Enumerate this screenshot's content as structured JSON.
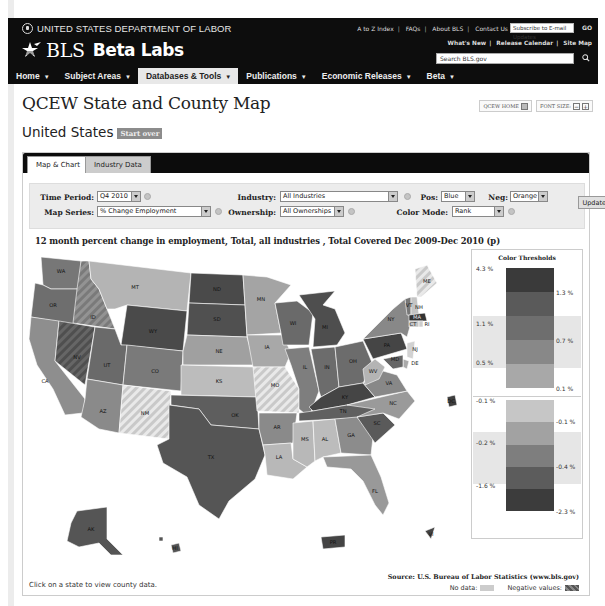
{
  "header": {
    "agency": "UNITED STATES DEPARTMENT OF LABOR",
    "brand_bls": "BLS",
    "brand_beta": "Beta Labs",
    "top_links": [
      "A to Z Index",
      "FAQs",
      "About BLS",
      "Contact Us"
    ],
    "subscribe_placeholder": "Subscribe to E-mail Updates",
    "go_label": "GO",
    "release_links": [
      "What's New",
      "Release Calendar",
      "Site Map"
    ],
    "search_placeholder": "Search BLS.gov",
    "nav": [
      {
        "label": "Home"
      },
      {
        "label": "Subject Areas"
      },
      {
        "label": "Databases & Tools",
        "active": true
      },
      {
        "label": "Publications"
      },
      {
        "label": "Economic Releases"
      },
      {
        "label": "Beta"
      }
    ]
  },
  "page": {
    "title": "QCEW State and County Map",
    "qcew_home": "QCEW HOME",
    "font_size": "FONT SIZE:",
    "font_minus": "−",
    "font_plus": "+",
    "region": "United States",
    "start_over": "Start over"
  },
  "tabs": [
    {
      "label": "Map & Chart",
      "active": true
    },
    {
      "label": "Industry Data"
    }
  ],
  "controls": {
    "time_period_label": "Time Period:",
    "time_period_value": "Q4 2010",
    "map_series_label": "Map Series:",
    "map_series_value": "% Change Employment",
    "industry_label": "Industry:",
    "industry_value": "All Industries",
    "ownership_label": "Ownership:",
    "ownership_value": "All Ownerships",
    "pos_label": "Pos:",
    "pos_value": "Blue",
    "neg_label": "Neg:",
    "neg_value": "Orange",
    "color_mode_label": "Color Mode:",
    "color_mode_value": "Rank",
    "update_label": "Update"
  },
  "chart_title": "12 month percent change in employment, Total, all industries , Total Covered Dec 2009-Dec 2010 (p)",
  "legend": {
    "title": "Color Thresholds",
    "positive": {
      "left_labels": [
        "4.3 %",
        "1.1 %",
        "0.5 %"
      ],
      "right_labels": [
        "1.3 %",
        "0.7 %",
        "0.1 %"
      ],
      "colors": [
        "#3a3a3a",
        "#5a5a5a",
        "#6e6e6e",
        "#888888",
        "#a8a8a8"
      ]
    },
    "negative": {
      "left_labels": [
        "-0.1 %",
        "-0.2 %",
        "-1.6 %"
      ],
      "right_labels": [
        "-0.1 %",
        "-0.4 %",
        "-2.3 %"
      ],
      "colors": [
        "#c6c6c6",
        "#a2a2a2",
        "#7e7e7e",
        "#5c5c5c",
        "#3c3c3c"
      ]
    }
  },
  "map": {
    "states": [
      {
        "code": "WA"
      },
      {
        "code": "OR"
      },
      {
        "code": "CA"
      },
      {
        "code": "ID"
      },
      {
        "code": "NV"
      },
      {
        "code": "MT"
      },
      {
        "code": "WY"
      },
      {
        "code": "UT"
      },
      {
        "code": "AZ"
      },
      {
        "code": "CO"
      },
      {
        "code": "NM"
      },
      {
        "code": "ND"
      },
      {
        "code": "SD"
      },
      {
        "code": "NE"
      },
      {
        "code": "KS"
      },
      {
        "code": "OK"
      },
      {
        "code": "TX"
      },
      {
        "code": "MN"
      },
      {
        "code": "IA"
      },
      {
        "code": "MO"
      },
      {
        "code": "AR"
      },
      {
        "code": "LA"
      },
      {
        "code": "WI"
      },
      {
        "code": "IL"
      },
      {
        "code": "MI"
      },
      {
        "code": "IN"
      },
      {
        "code": "OH"
      },
      {
        "code": "KY"
      },
      {
        "code": "TN"
      },
      {
        "code": "MS"
      },
      {
        "code": "AL"
      },
      {
        "code": "GA"
      },
      {
        "code": "FL"
      },
      {
        "code": "SC"
      },
      {
        "code": "NC"
      },
      {
        "code": "VA"
      },
      {
        "code": "WV"
      },
      {
        "code": "PA"
      },
      {
        "code": "NY"
      },
      {
        "code": "VT"
      },
      {
        "code": "NH"
      },
      {
        "code": "ME"
      },
      {
        "code": "MA"
      },
      {
        "code": "CT"
      },
      {
        "code": "RI"
      },
      {
        "code": "NJ"
      },
      {
        "code": "DE"
      },
      {
        "code": "MD"
      },
      {
        "code": "DC"
      },
      {
        "code": "AK"
      },
      {
        "code": "HI"
      },
      {
        "code": "PR"
      },
      {
        "code": "VI"
      }
    ]
  },
  "footer": {
    "click_hint": "Click on a state to view county data.",
    "source": "Source: U.S. Bureau of Labor Statistics (www.bls.gov)",
    "no_data_label": "No data:",
    "negative_label": "Negative values:"
  }
}
